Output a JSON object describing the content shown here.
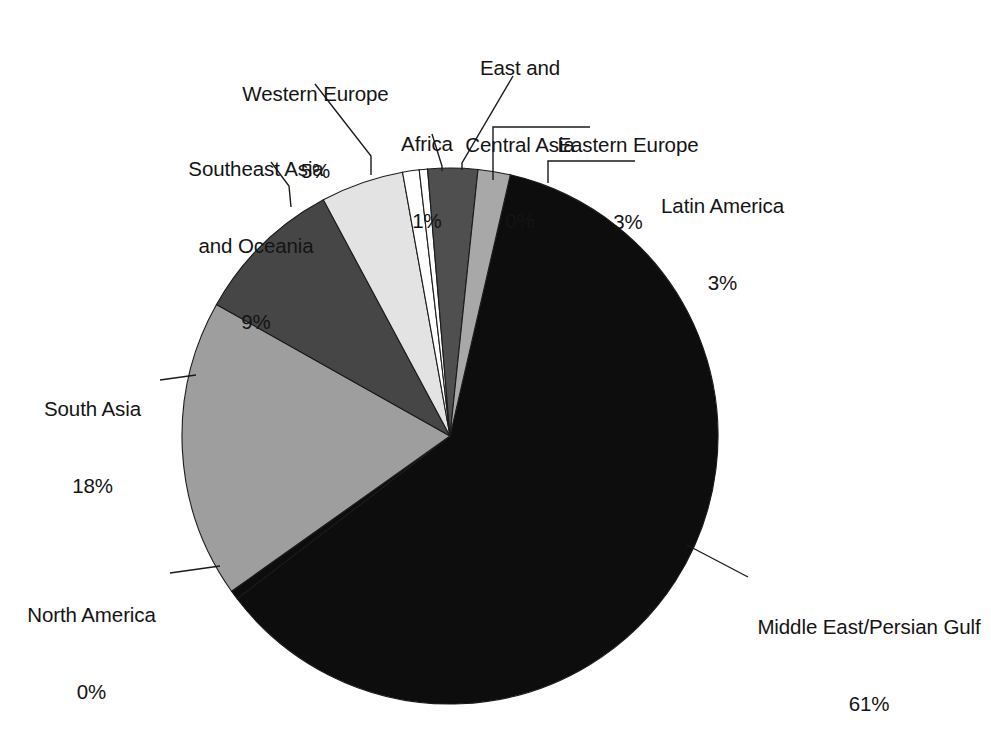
{
  "chart_data": {
    "type": "pie",
    "title": "",
    "subtitle": "",
    "xlabel": "",
    "ylabel": "",
    "legend_position": "none",
    "grid": false,
    "value_unit": "%",
    "labels_show_percent": true,
    "total_percent": 100,
    "categories": [
      "Middle East/Persian Gulf",
      "North America",
      "South Asia",
      "Southeast Asia and Oceania",
      "Western Europe",
      "Africa",
      "East and Central Asia",
      "Eastern Europe",
      "Latin America"
    ],
    "values": [
      61,
      0,
      18,
      9,
      5,
      1,
      0,
      3,
      3
    ],
    "slices": [
      {
        "name": "Middle East/Persian Gulf",
        "label_line1": "Middle East/Persian Gulf",
        "label_line2": "61%",
        "value": 61,
        "percent_text": "61%",
        "color": "#0d0d0d",
        "start_angle": 13.0,
        "end_angle": 232.6
      },
      {
        "name": "North America",
        "label_line1": "North America",
        "label_line2": "0%",
        "value": 0,
        "percent_text": "0%",
        "color": "#0d0d0d",
        "start_angle": 232.6,
        "end_angle": 234.6
      },
      {
        "name": "South Asia",
        "label_line1": "South Asia",
        "label_line2": "18%",
        "value": 18,
        "percent_text": "18%",
        "color": "#9e9e9e",
        "start_angle": 234.6,
        "end_angle": 299.4
      },
      {
        "name": "Southeast Asia and Oceania",
        "label_line1": "Southeast Asia",
        "label_line2": "and Oceania",
        "label_line3": "9%",
        "value": 9,
        "percent_text": "9%",
        "color": "#464646",
        "start_angle": 299.4,
        "end_angle": 331.8
      },
      {
        "name": "Western Europe",
        "label_line1": "Western Europe",
        "label_line2": "5%",
        "value": 5,
        "percent_text": "5%",
        "color": "#e3e3e3",
        "start_angle": 331.8,
        "end_angle": 349.8
      },
      {
        "name": "Africa",
        "label_line1": "Africa",
        "label_line2": "1%",
        "value": 1,
        "percent_text": "1%",
        "color": "#ffffff",
        "start_angle": 349.8,
        "end_angle": 353.4
      },
      {
        "name": "East and Central Asia",
        "label_line1": "East and",
        "label_line2": "Central Asia",
        "label_line3": "0%",
        "value": 0,
        "percent_text": "0%",
        "color": "#ffffff",
        "start_angle": 353.4,
        "end_angle": 355.2
      },
      {
        "name": "Eastern Europe",
        "label_line1": "Eastern Europe",
        "label_line2": "3%",
        "value": 3,
        "percent_text": "3%",
        "color": "#4f4f4f",
        "start_angle": 355.2,
        "end_angle": 366.0
      },
      {
        "name": "Latin America",
        "label_line1": "Latin America",
        "label_line2": "3%",
        "value": 3,
        "percent_text": "3%",
        "color": "#a8a8a8",
        "start_angle": 366.0,
        "end_angle": 373.0
      }
    ]
  },
  "labels": {
    "western_europe": {
      "name": "Western Europe",
      "percent": "5%"
    },
    "east_central_asia": {
      "name_line1": "East and",
      "name_line2": "Central Asia",
      "percent": "0%"
    },
    "africa": {
      "name": "Africa",
      "percent": "1%"
    },
    "eastern_europe": {
      "name": "Eastern Europe",
      "percent": "3%"
    },
    "latin_america": {
      "name": "Latin America",
      "percent": "3%"
    },
    "southeast_asia": {
      "name_line1": "Southeast Asia",
      "name_line2": "and Oceania",
      "percent": "9%"
    },
    "south_asia": {
      "name": "South Asia",
      "percent": "18%"
    },
    "north_america": {
      "name": "North America",
      "percent": "0%"
    },
    "middle_east": {
      "name": "Middle East/Persian Gulf",
      "percent": "61%"
    }
  },
  "colors": {
    "background": "#ffffff",
    "outline": "#1b1b1b",
    "text": "#141414",
    "black_slice": "#0d0d0d",
    "dark_gray_slice": "#464646",
    "eastern_europe_gray": "#4f4f4f",
    "mid_gray_slice": "#9e9e9e",
    "latin_gray_slice": "#a8a8a8",
    "light_gray_slice": "#e3e3e3",
    "white_slice": "#ffffff"
  }
}
